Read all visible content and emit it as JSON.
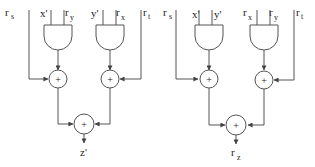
{
  "diagram": {
    "type": "circuit",
    "left_circuit": {
      "inputs": {
        "rs": {
          "base": "r",
          "sub": "s"
        },
        "x_prime": "x'",
        "ry": {
          "base": "r",
          "sub": "y"
        },
        "y_prime": "y'",
        "rx": {
          "base": "r",
          "sub": "x"
        },
        "rt": {
          "base": "r",
          "sub": "t"
        }
      },
      "gates": [
        {
          "type": "AND",
          "inputs": [
            "x'",
            "r_y"
          ]
        },
        {
          "type": "AND",
          "inputs": [
            "y'",
            "r_x"
          ]
        }
      ],
      "adders": [
        {
          "symbol": "+",
          "inputs": [
            "r_s",
            "AND1"
          ]
        },
        {
          "symbol": "+",
          "inputs": [
            "AND2",
            "r_t"
          ]
        },
        {
          "symbol": "+",
          "inputs": [
            "ADD1",
            "ADD2"
          ]
        }
      ],
      "output": "z'"
    },
    "right_circuit": {
      "inputs": {
        "rs": {
          "base": "r",
          "sub": "s"
        },
        "x_prime": "x'",
        "y_prime": "y'",
        "rx": {
          "base": "r",
          "sub": "x"
        },
        "ry": {
          "base": "r",
          "sub": "y"
        },
        "rt": {
          "base": "r",
          "sub": "t"
        }
      },
      "gates": [
        {
          "type": "AND",
          "inputs": [
            "x'",
            "y'"
          ]
        },
        {
          "type": "AND",
          "inputs": [
            "r_x",
            "r_y"
          ]
        }
      ],
      "adders": [
        {
          "symbol": "+",
          "inputs": [
            "r_s",
            "AND1"
          ]
        },
        {
          "symbol": "+",
          "inputs": [
            "AND2",
            "r_t"
          ]
        },
        {
          "symbol": "+",
          "inputs": [
            "ADD1",
            "ADD2"
          ]
        }
      ],
      "output": {
        "base": "r",
        "sub": "z"
      }
    },
    "plus_symbol": "+"
  }
}
